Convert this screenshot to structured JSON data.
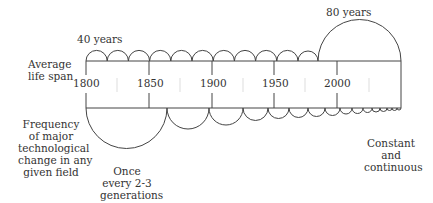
{
  "labels": {
    "top_small": "40 years",
    "top_large": "80 years",
    "left_top": [
      "Average",
      "life span"
    ],
    "left_bottom": [
      "Frequency",
      "of major",
      "technological",
      "change in any",
      "given field"
    ],
    "bottom_left": [
      "Once",
      "every 2-3",
      "generations"
    ],
    "bottom_right": [
      "Constant",
      "and",
      "continuous"
    ]
  },
  "axis": {
    "years": [
      "1800",
      "1850",
      "1900",
      "1950",
      "2000"
    ]
  },
  "colors": {
    "line": "#444444",
    "text": "#333333",
    "minor_tick": "#dddddd"
  }
}
